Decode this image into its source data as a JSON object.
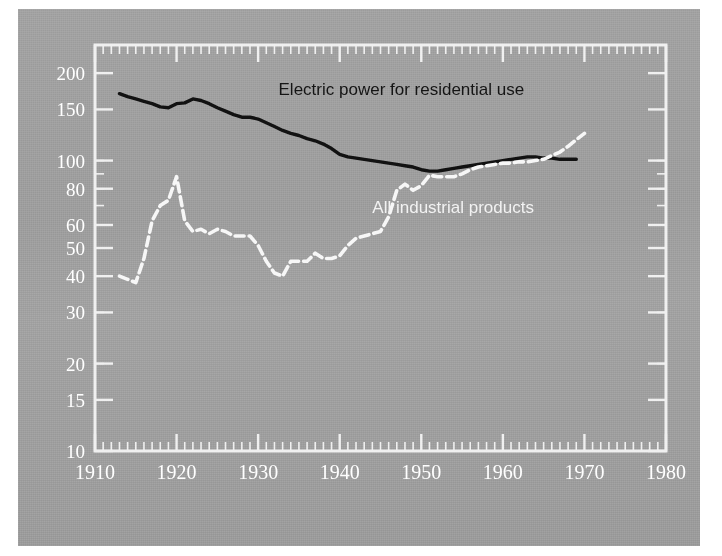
{
  "figure": {
    "plate_background": "#9e9e9e",
    "page_background": "#ffffff",
    "frame_color": "#f0f0f0"
  },
  "chart_data": {
    "type": "line",
    "title": "",
    "subtitle": "",
    "xlabel": "",
    "ylabel": "",
    "scale": "log",
    "grid": false,
    "legend_position": "inline-annotation",
    "xlim": [
      1910,
      1980
    ],
    "ylim": [
      10,
      250
    ],
    "xticks": [
      1910,
      1920,
      1930,
      1940,
      1950,
      1960,
      1970,
      1980
    ],
    "xtick_labels": [
      "1910",
      "1920",
      "1930",
      "1940",
      "1950",
      "1960",
      "1970",
      "1980"
    ],
    "yticks": [
      10,
      15,
      20,
      30,
      40,
      50,
      60,
      80,
      100,
      150,
      200
    ],
    "ytick_labels": [
      "10",
      "15",
      "20",
      "30",
      "40",
      "50",
      "60",
      "80",
      "100",
      "150",
      "200"
    ],
    "minor_xtick_interval": 1,
    "annotations": [
      {
        "name": "electric-power-label",
        "text": "Electric power for residential use",
        "x": 1932.5,
        "y": 168,
        "color": "#141414"
      },
      {
        "name": "industrial-products-label",
        "text": "All industrial products",
        "x": 1944.0,
        "y": 66,
        "color": "#f2f2f2"
      }
    ],
    "series": [
      {
        "name": "Electric power for residential use",
        "style": "solid",
        "color": "#111111",
        "width": 3.4,
        "x": [
          1913,
          1914,
          1915,
          1916,
          1917,
          1918,
          1919,
          1920,
          1921,
          1922,
          1923,
          1924,
          1925,
          1926,
          1927,
          1928,
          1929,
          1930,
          1931,
          1932,
          1933,
          1934,
          1935,
          1936,
          1937,
          1938,
          1939,
          1940,
          1941,
          1942,
          1943,
          1944,
          1945,
          1946,
          1947,
          1948,
          1949,
          1950,
          1951,
          1952,
          1953,
          1954,
          1955,
          1956,
          1957,
          1958,
          1959,
          1960,
          1961,
          1962,
          1963,
          1964,
          1965,
          1966,
          1967,
          1968,
          1969
        ],
        "values": [
          170,
          166,
          163,
          160,
          157,
          153,
          152,
          157,
          158,
          163,
          161,
          157,
          152,
          148,
          144,
          141,
          141,
          139,
          135,
          131,
          127,
          124,
          122,
          119,
          117,
          114,
          110,
          105,
          103,
          102,
          101,
          100,
          99,
          98,
          97,
          96,
          95,
          93,
          92,
          92,
          93,
          94,
          95,
          96,
          97,
          98,
          99,
          100,
          101,
          102,
          103,
          103,
          102,
          102,
          101,
          101,
          101
        ]
      },
      {
        "name": "All industrial products",
        "style": "dashed",
        "color": "#f7f7f7",
        "width": 3.6,
        "x": [
          1913,
          1914,
          1915,
          1916,
          1917,
          1918,
          1919,
          1920,
          1921,
          1922,
          1923,
          1924,
          1925,
          1926,
          1927,
          1928,
          1929,
          1930,
          1931,
          1932,
          1933,
          1934,
          1935,
          1936,
          1937,
          1938,
          1939,
          1940,
          1941,
          1942,
          1943,
          1944,
          1945,
          1946,
          1947,
          1948,
          1949,
          1950,
          1951,
          1952,
          1953,
          1954,
          1955,
          1956,
          1957,
          1958,
          1959,
          1960,
          1961,
          1962,
          1963,
          1964,
          1965,
          1966,
          1967,
          1968,
          1969,
          1970
        ],
        "values": [
          40,
          39,
          38,
          46,
          62,
          70,
          73,
          88,
          62,
          57,
          58,
          56,
          58,
          57,
          55,
          55,
          55,
          51,
          45,
          41,
          40,
          45,
          45,
          45,
          48,
          46,
          46,
          47,
          51,
          54,
          55,
          56,
          57,
          64,
          79,
          83,
          79,
          82,
          89,
          88,
          88,
          88,
          90,
          93,
          95,
          96,
          97,
          98,
          98,
          99,
          99,
          100,
          101,
          104,
          107,
          112,
          118,
          124
        ]
      }
    ]
  }
}
